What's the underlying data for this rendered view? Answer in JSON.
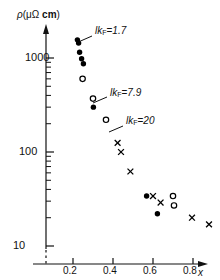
{
  "figure": {
    "y_axis_title_rho": "ρ",
    "y_axis_title_open": "(",
    "y_axis_title_mu_omega": "μΩ",
    "y_axis_title_cm": "cm",
    "y_axis_title_close": ")",
    "x_axis_title": "x"
  },
  "chart_data": {
    "type": "scatter",
    "title": "",
    "xlabel": "x",
    "ylabel": "ρ (μΩ cm)",
    "xscale": "linear",
    "yscale": "log",
    "xlim": [
      0.0,
      0.95
    ],
    "ylim": [
      10,
      2000
    ],
    "grid": false,
    "legend": "none",
    "xticks": [
      0.2,
      0.4,
      0.6,
      0.8
    ],
    "xtick_labels": [
      "0.2",
      "0.4",
      "0.6",
      "0.8"
    ],
    "yticks": [
      10,
      100,
      1000
    ],
    "ytick_labels": [
      "10",
      "100",
      "1000"
    ],
    "y_minor_ticks": [
      20,
      30,
      40,
      50,
      60,
      70,
      80,
      90,
      200,
      300,
      400,
      500,
      600,
      700,
      800,
      900,
      2000
    ],
    "axis_break_below": 10,
    "series": [
      {
        "name": "filled-circle",
        "marker": "filled-circle",
        "color": "#000000",
        "points": [
          {
            "x": 0.222,
            "y": 1560
          },
          {
            "x": 0.228,
            "y": 1440
          },
          {
            "x": 0.233,
            "y": 1150
          },
          {
            "x": 0.243,
            "y": 980
          },
          {
            "x": 0.252,
            "y": 870
          },
          {
            "x": 0.302,
            "y": 300
          },
          {
            "x": 0.568,
            "y": 34
          },
          {
            "x": 0.622,
            "y": 22
          }
        ]
      },
      {
        "name": "open-circle",
        "marker": "open-circle",
        "color": "#000000",
        "points": [
          {
            "x": 0.248,
            "y": 600
          },
          {
            "x": 0.3,
            "y": 370
          },
          {
            "x": 0.365,
            "y": 220
          },
          {
            "x": 0.7,
            "y": 34
          },
          {
            "x": 0.705,
            "y": 27
          }
        ]
      },
      {
        "name": "cross",
        "marker": "cross",
        "color": "#000000",
        "points": [
          {
            "x": 0.423,
            "y": 125
          },
          {
            "x": 0.44,
            "y": 100
          },
          {
            "x": 0.487,
            "y": 62
          },
          {
            "x": 0.6,
            "y": 34
          },
          {
            "x": 0.638,
            "y": 29
          },
          {
            "x": 0.795,
            "y": 20
          },
          {
            "x": 0.88,
            "y": 17
          }
        ]
      }
    ],
    "annotations": [
      {
        "name": "lkf-1p7",
        "prefix": "lk",
        "sub": "F",
        "eq": "=",
        "value": "1.7",
        "text": "lk_F = 1.7",
        "label_x": 95,
        "label_y": 26,
        "leader": {
          "x1": 92,
          "y1": 36,
          "x2": 76,
          "y2": 43
        }
      },
      {
        "name": "lkf-7p9",
        "prefix": "lk",
        "sub": "F",
        "eq": "=",
        "value": "7.9",
        "text": "lk_F = 7.9",
        "label_x": 110,
        "label_y": 88,
        "leader": {
          "x1": 107,
          "y1": 97,
          "x2": 93,
          "y2": 103
        }
      },
      {
        "name": "lkf-20",
        "prefix": "lk",
        "sub": "F",
        "eq": "=",
        "value": "20",
        "text": "lk_F = 20",
        "label_x": 126,
        "label_y": 116,
        "leader": {
          "x1": 123,
          "y1": 126,
          "x2": 109,
          "y2": 132
        }
      }
    ]
  }
}
